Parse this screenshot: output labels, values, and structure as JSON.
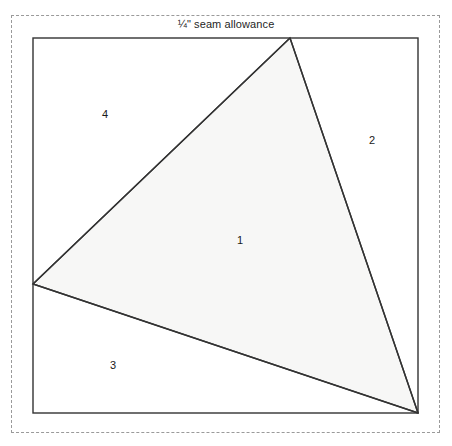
{
  "document": {
    "type": "foundation-paper-piecing-pattern",
    "background_color": "#ffffff"
  },
  "seam_allowance": {
    "caption": "¼\" seam allowance",
    "border_style": "dashed",
    "border_color": "#9a9a9a",
    "bounds": {
      "x": 11,
      "y": 15,
      "width": 429,
      "height": 418
    }
  },
  "block": {
    "outline_color": "#333333",
    "bounds": {
      "x": 33,
      "y": 38,
      "width": 385,
      "height": 375
    }
  },
  "pieces": [
    {
      "number": "1",
      "shape": "triangle",
      "fill": "#f7f7f6",
      "stroke": "#333333",
      "points": "290,38 418,413 33,284",
      "label_x": 240,
      "label_y": 240
    },
    {
      "number": "2",
      "shape": "corner-right",
      "fill": "#ffffff",
      "stroke": "#333333",
      "points": "290,38 418,38 418,413",
      "label_x": 372,
      "label_y": 140
    },
    {
      "number": "3",
      "shape": "corner-bottom-left",
      "fill": "#ffffff",
      "stroke": "#333333",
      "points": "33,284 418,413 33,413",
      "label_x": 113,
      "label_y": 365
    },
    {
      "number": "4",
      "shape": "corner-top-left",
      "fill": "#ffffff",
      "stroke": "#333333",
      "points": "33,38 290,38 33,284",
      "label_x": 105,
      "label_y": 114
    }
  ],
  "colors": {
    "piece_one_fill": "#f7f7f6",
    "line": "#333333",
    "dashed_line": "#9a9a9a",
    "text": "#1a1a1a"
  }
}
